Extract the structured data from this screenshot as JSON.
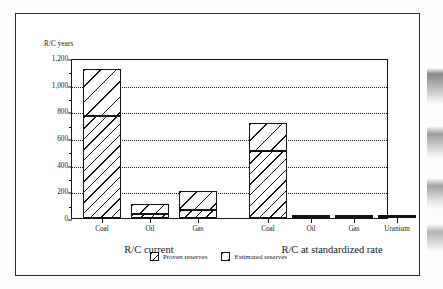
{
  "chart_data": {
    "type": "bar",
    "subtype": "stacked-bar",
    "title": "",
    "ylabel": "R/C years",
    "xlabel": "",
    "ylim": [
      0,
      1200
    ],
    "yticks": [
      "0",
      "200",
      "400",
      "600",
      "800",
      "1,000",
      "1,200"
    ],
    "ytick_values": [
      0,
      200,
      400,
      600,
      800,
      1000,
      1200
    ],
    "grid": "horizontal-dotted",
    "legend_position": "bottom-center",
    "legend": [
      "Proven reserves",
      "Estimated reserves"
    ],
    "groups": [
      {
        "name": "R/C current",
        "categories": [
          "Coal",
          "Oil",
          "Gas"
        ]
      },
      {
        "name": "R/C at standardized rate",
        "categories": [
          "Coal",
          "Oil",
          "Gas",
          "Uranium"
        ]
      }
    ],
    "categories": [
      "Coal",
      "Oil",
      "Gas",
      "Coal",
      "Oil",
      "Gas",
      "Uranium"
    ],
    "series": [
      {
        "name": "Proven reserves",
        "values": [
          765,
          30,
          60,
          500,
          8,
          4,
          9
        ]
      },
      {
        "name": "Estimated reserves",
        "values": [
          350,
          75,
          140,
          215,
          4,
          3,
          5
        ]
      }
    ],
    "totals": [
      1115,
      105,
      200,
      715,
      12,
      7,
      14
    ],
    "bars": [
      {
        "group": 0,
        "category": "Coal",
        "proven": 765,
        "estimated": 350,
        "total": 1115
      },
      {
        "group": 0,
        "category": "Oil",
        "proven": 30,
        "estimated": 75,
        "total": 105
      },
      {
        "group": 0,
        "category": "Gas",
        "proven": 60,
        "estimated": 140,
        "total": 200
      },
      {
        "group": 1,
        "category": "Coal",
        "proven": 500,
        "estimated": 215,
        "total": 715
      },
      {
        "group": 1,
        "category": "Oil",
        "proven": 8,
        "estimated": 4,
        "total": 12
      },
      {
        "group": 1,
        "category": "Gas",
        "proven": 4,
        "estimated": 3,
        "total": 7
      },
      {
        "group": 1,
        "category": "Uranium",
        "proven": 9,
        "estimated": 5,
        "total": 14
      }
    ],
    "colors": {
      "axis": "#141414",
      "grid": "#1d1d1d",
      "bar_outline": "#111111",
      "bar_fill": "#ffffff",
      "background": "#ffffff"
    }
  },
  "axis": {
    "y_title": "R/C years",
    "y_ticks": [
      {
        "label": "1,200",
        "value": 1200
      },
      {
        "label": "1,000",
        "value": 1000
      },
      {
        "label": "800",
        "value": 800
      },
      {
        "label": "600",
        "value": 600
      },
      {
        "label": "400",
        "value": 400
      },
      {
        "label": "200",
        "value": 200
      },
      {
        "label": "0",
        "value": 0
      }
    ],
    "x_labels": [
      "Coal",
      "Oil",
      "Gas",
      "Coal",
      "Oil",
      "Gas",
      "Uranium"
    ],
    "group_labels": [
      "R/C current",
      "R/C at standardized rate"
    ]
  },
  "legend": {
    "items": [
      {
        "label": "Proven reserves",
        "pattern": "diagonal-hatch-dense"
      },
      {
        "label": "Estimated reserves",
        "pattern": "diagonal-hatch-sparse"
      }
    ]
  }
}
